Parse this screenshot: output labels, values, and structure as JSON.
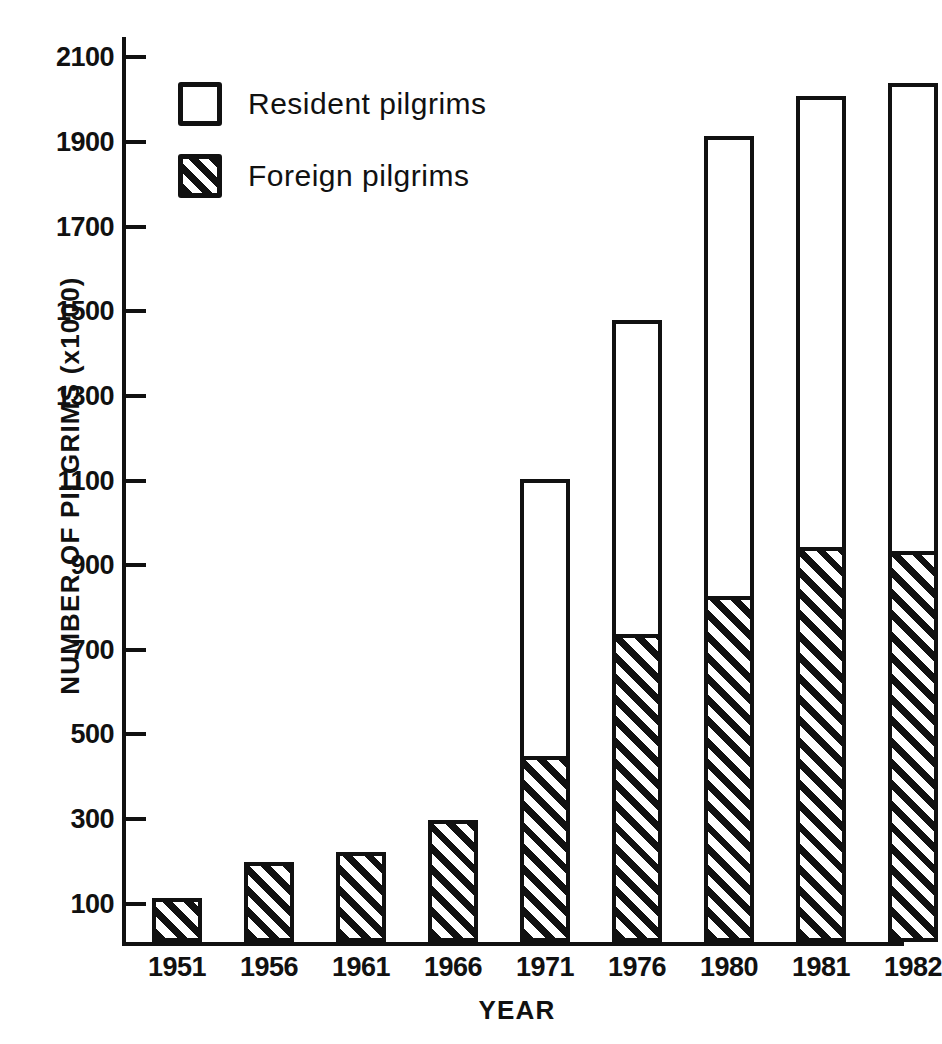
{
  "chart_data": {
    "type": "bar",
    "subtype": "stacked-bar",
    "title": "",
    "xlabel": "YEAR",
    "ylabel": "NUMBER OF PILGRIMS (x1000)",
    "categories": [
      "1951",
      "1956",
      "1961",
      "1966",
      "1971",
      "1976",
      "1980",
      "1981",
      "1982"
    ],
    "series": [
      {
        "name": "Foreign pilgrims",
        "pattern": "diagonal-hatch",
        "values": [
          105,
          190,
          212,
          288,
          435,
          722,
          812,
          928,
          918
        ]
      },
      {
        "name": "Resident pilgrims",
        "pattern": "empty-white",
        "values": [
          0,
          0,
          0,
          0,
          660,
          748,
          1093,
          1072,
          1112
        ]
      }
    ],
    "totals": [
      105,
      190,
      212,
      288,
      1095,
      1470,
      1905,
      2000,
      2030
    ],
    "ylim": [
      0,
      2160
    ],
    "yticks": [
      100,
      300,
      500,
      700,
      900,
      1100,
      1300,
      1500,
      1700,
      1900,
      2100
    ],
    "ytick_labels": [
      "100",
      "300",
      "500",
      "700",
      "900",
      "1100",
      "1300",
      "1500",
      "1700",
      "1900",
      "2100"
    ],
    "grid": false,
    "legend_position": "upper-left-inside",
    "legend": [
      {
        "label": "Resident pilgrims",
        "swatch": "empty-white"
      },
      {
        "label": "Foreign pilgrims",
        "swatch": "diagonal-hatch"
      }
    ],
    "colors": {
      "ink": "#111111",
      "background": "#ffffff"
    }
  }
}
